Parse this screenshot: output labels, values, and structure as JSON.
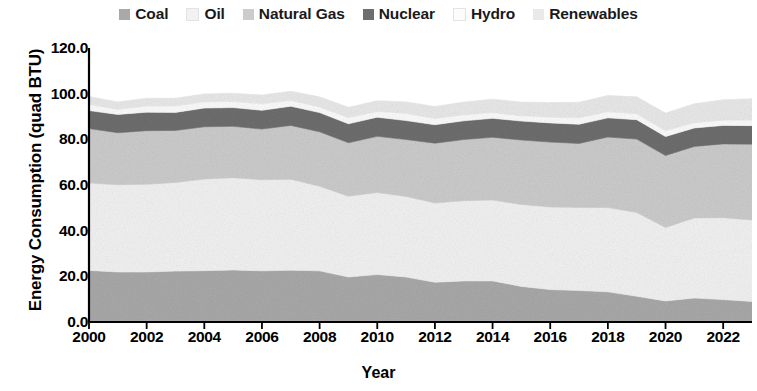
{
  "legend": {
    "position": "top-center",
    "items": [
      {
        "label": "Coal",
        "color": "#a9a9a9"
      },
      {
        "label": "Oil",
        "color": "#f2f2f2"
      },
      {
        "label": "Natural Gas",
        "color": "#cccccc"
      },
      {
        "label": "Nuclear",
        "color": "#6e6e6e"
      },
      {
        "label": "Hydro",
        "color": "#fcfcfc"
      },
      {
        "label": "Renewables",
        "color": "#e9e9e9"
      }
    ]
  },
  "axes": {
    "ylabel": "Energy Consumption (quad BTU)",
    "xlabel": "Year",
    "yticks": [
      "0.0",
      "20.0",
      "40.0",
      "60.0",
      "80.0",
      "100.0",
      "120.0"
    ],
    "xticks": [
      "2000",
      "2002",
      "2004",
      "2006",
      "2008",
      "2010",
      "2012",
      "2014",
      "2016",
      "2018",
      "2020",
      "2022"
    ]
  },
  "chart_data": {
    "type": "area",
    "stacked": true,
    "title": "",
    "xlabel": "Year",
    "ylabel": "Energy Consumption (quad BTU)",
    "grid": false,
    "legend_position": "top-center",
    "ylim": [
      0,
      120
    ],
    "xlim": [
      2000,
      2023
    ],
    "ytick_values": [
      0,
      20,
      40,
      60,
      80,
      100,
      120
    ],
    "xtick_values": [
      2000,
      2002,
      2004,
      2006,
      2008,
      2010,
      2012,
      2014,
      2016,
      2018,
      2020,
      2022
    ],
    "x": [
      2000,
      2001,
      2002,
      2003,
      2004,
      2005,
      2006,
      2007,
      2008,
      2009,
      2010,
      2011,
      2012,
      2013,
      2014,
      2015,
      2016,
      2017,
      2018,
      2019,
      2020,
      2021,
      2022,
      2023
    ],
    "series": [
      {
        "name": "Coal",
        "color": "#a9a9a9",
        "values": [
          22.6,
          21.9,
          21.9,
          22.3,
          22.5,
          22.8,
          22.4,
          22.7,
          22.4,
          19.7,
          20.8,
          19.7,
          17.4,
          18.0,
          18.0,
          15.6,
          14.2,
          13.8,
          13.2,
          11.3,
          9.2,
          10.5,
          9.8,
          9.0
        ]
      },
      {
        "name": "Oil",
        "color": "#f2f2f2",
        "values": [
          38.3,
          38.2,
          38.4,
          38.8,
          40.1,
          40.4,
          39.9,
          39.8,
          37.1,
          35.4,
          35.9,
          35.3,
          34.7,
          35.1,
          35.4,
          35.9,
          36.2,
          36.4,
          36.9,
          36.7,
          32.2,
          35.1,
          35.9,
          35.7
        ]
      },
      {
        "name": "Natural Gas",
        "color": "#cccccc",
        "values": [
          23.8,
          22.8,
          23.5,
          22.8,
          22.9,
          22.5,
          22.2,
          23.6,
          23.8,
          23.4,
          24.6,
          24.9,
          26.2,
          26.8,
          27.5,
          28.2,
          28.4,
          28.0,
          30.9,
          32.1,
          31.5,
          31.3,
          32.3,
          33.2
        ]
      },
      {
        "name": "Nuclear",
        "color": "#6e6e6e",
        "values": [
          7.9,
          8.0,
          8.1,
          7.9,
          8.2,
          8.2,
          8.2,
          8.4,
          8.4,
          8.3,
          8.4,
          8.3,
          8.1,
          8.2,
          8.3,
          8.3,
          8.4,
          8.4,
          8.4,
          8.5,
          8.3,
          8.1,
          8.1,
          8.1
        ]
      },
      {
        "name": "Hydro",
        "color": "#fcfcfc",
        "values": [
          2.8,
          2.2,
          2.7,
          2.8,
          2.7,
          2.7,
          2.9,
          2.5,
          2.5,
          2.7,
          2.5,
          3.1,
          2.7,
          2.6,
          2.5,
          2.3,
          2.5,
          2.8,
          2.7,
          2.6,
          2.6,
          2.3,
          2.3,
          2.4
        ]
      },
      {
        "name": "Renewables",
        "color": "#e9e9e9",
        "values": [
          3.4,
          3.3,
          3.4,
          3.4,
          3.5,
          3.6,
          3.8,
          4.1,
          4.4,
          4.5,
          4.7,
          5.1,
          5.3,
          5.6,
          5.9,
          6.0,
          6.4,
          6.8,
          7.1,
          7.4,
          7.7,
          8.3,
          8.9,
          9.4
        ]
      }
    ],
    "totals": [
      98.8,
      96.4,
      98.0,
      98.0,
      99.9,
      100.2,
      99.4,
      101.1,
      98.6,
      94.0,
      96.9,
      96.4,
      94.4,
      96.3,
      97.6,
      96.3,
      96.1,
      96.2,
      99.2,
      98.6,
      91.5,
      95.6,
      97.3,
      97.8
    ]
  }
}
